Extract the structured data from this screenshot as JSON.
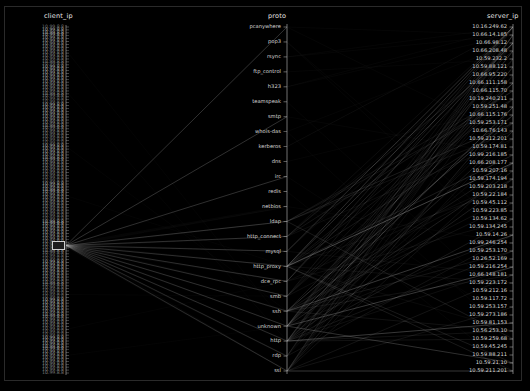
{
  "chart_data": {
    "type": "line",
    "subtype": "parallel-coordinates",
    "title": "",
    "background": "#000000",
    "line_color": "#c8c8c8",
    "axis_color": "#b4b4b4",
    "label_color": "#d8d8d8",
    "axes": [
      {
        "name": "client_ip",
        "title": "client_ip",
        "position": "left",
        "x": 66,
        "y_top": 27,
        "y_bottom": 373
      },
      {
        "name": "proto",
        "title": "proto",
        "position": "middle",
        "x": 287,
        "y_top": 27,
        "y_bottom": 371
      },
      {
        "name": "server_ip",
        "title": "server_ip",
        "position": "right",
        "x": 513,
        "y_top": 27,
        "y_bottom": 371
      }
    ],
    "proto_categories": [
      "pcanywhere",
      "pop3",
      "rsync",
      "ftp_control",
      "h323",
      "teamspeak",
      "smtp",
      "whois-das",
      "kerberos",
      "dns",
      "irc",
      "redis",
      "netbios",
      "ldap",
      "http_connect",
      "mysql",
      "http_proxy",
      "dce_rpc",
      "smb",
      "ssh",
      "unknown",
      "http",
      "rdp",
      "ssl"
    ],
    "server_ip_categories": [
      "10.16.249.62",
      "10.66.14.185",
      "10.66.98.12",
      "10.66.208.48",
      "10.59.232.2",
      "10.59.88.121",
      "10.66.95.220",
      "10.66.111.158",
      "10.66.115.70",
      "10.19.240.211",
      "10.59.251.48",
      "10.66.115.176",
      "10.59.253.171",
      "10.66.76.143",
      "10.59.212.201",
      "10.59.174.81",
      "10.99.216.185",
      "10.66.208.177",
      "10.59.207.16",
      "10.59.174.194",
      "10.59.203.218",
      "10.59.22.184",
      "10.59.45.112",
      "10.59.223.85",
      "10.59.134.62",
      "10.59.134.245",
      "10.59.14.26",
      "10.99.246.254",
      "10.59.253.170",
      "10.26.52.169",
      "10.59.216.254",
      "10.66.148.181",
      "10.59.223.172",
      "10.59.212.16",
      "10.59.117.72",
      "10.59.253.157",
      "10.59.273.186",
      "10.59.81.153",
      "10.56.253.10",
      "10.59.259.68",
      "10.59.45.245",
      "10.59.88.211",
      "10.59.21.10",
      "10.59.211.201"
    ],
    "client_ip_count": 120,
    "client_ip_sample": "10.99.8.8",
    "legend": [],
    "grid": false
  },
  "axis_titles": {
    "client_ip": "client_ip",
    "proto": "proto",
    "server_ip": "server_ip"
  }
}
